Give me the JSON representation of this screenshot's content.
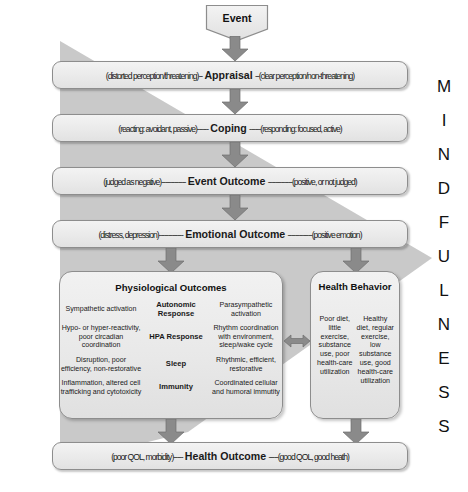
{
  "figure": {
    "wedge_label": "MINDFULNESS",
    "wedge_letters": [
      "M",
      "I",
      "N",
      "D",
      "F",
      "U",
      "L",
      "N",
      "E",
      "S",
      "S"
    ],
    "colors": {
      "wedge": "#c9c9c9",
      "box_fill": "#eaeaea",
      "box_border": "#8d8d8d",
      "arrow": "#8a8a8a",
      "text": "#1a1a1a"
    }
  },
  "event": {
    "label": "Event"
  },
  "stages": [
    {
      "id": "appraisal",
      "left": "(distorted perception/threatening)--",
      "title": "Appraisal",
      "right": "--(clear perception/non-threatening)"
    },
    {
      "id": "coping",
      "left": "(reacting: avoidant, passive)------",
      "title": "Coping",
      "right": "------(responding: focused, active)"
    },
    {
      "id": "event-outcome",
      "left": "(judged as negative)-------------",
      "title": "Event Outcome",
      "right": "-------------(positive, or not judged)"
    },
    {
      "id": "emotional-outcome",
      "left": "(distress, depression)-------------",
      "title": "Emotional Outcome",
      "right": "-------------(positive emotion)"
    }
  ],
  "physiological": {
    "title": "Physiological Outcomes",
    "rows": [
      {
        "negative": "Sympathetic activation",
        "system": "Autonomic Response",
        "positive": "Parasympathetic activation"
      },
      {
        "negative": "Hypo- or hyper-reactivity, poor circadian coordination",
        "system": "HPA Response",
        "positive": "Rhythm coordination with environment, sleep/wake cycle"
      },
      {
        "negative": "Disruption, poor efficiency, non-restorative",
        "system": "Sleep",
        "positive": "Rhythmic, efficient, restorative"
      },
      {
        "negative": "Inflammation, altered cell trafficking and cytotoxicity",
        "system": "Immunity",
        "positive": "Coordinated cellular and humoral immutity"
      }
    ]
  },
  "health_behavior": {
    "title": "Health Behavior",
    "negative": "Poor diet, little exercise, substance use, poor health-care utilization",
    "positive": "Healthy diet, regular exercise, low substance use, good health-care utilization"
  },
  "health_outcome": {
    "left": "(poor QOL, morbidity)-----",
    "title": "Health Outcome",
    "right": "-----(good QOL, good heath)"
  }
}
